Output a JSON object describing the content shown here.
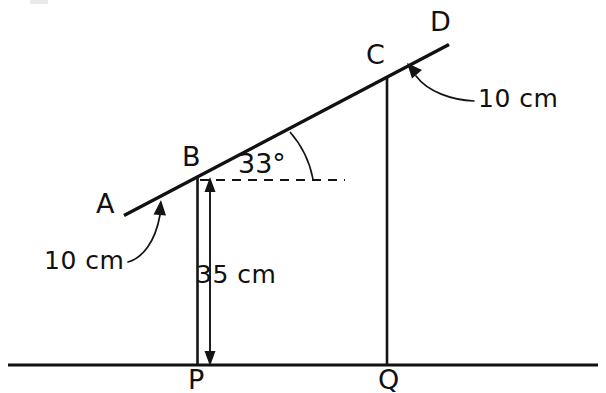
{
  "diagram": {
    "type": "geometry-line-diagram",
    "points": {
      "A": {
        "label": "A",
        "x": 125,
        "y": 215
      },
      "B": {
        "label": "B",
        "x": 196,
        "y": 178
      },
      "C": {
        "label": "C",
        "x": 386,
        "y": 77
      },
      "D": {
        "label": "D",
        "x": 448,
        "y": 45
      },
      "P": {
        "label": "P",
        "x": 197,
        "y": 365
      },
      "Q": {
        "label": "Q",
        "x": 387,
        "y": 365
      }
    },
    "labels": {
      "point_a": "A",
      "point_b": "B",
      "point_c": "C",
      "point_d": "D",
      "point_p": "P",
      "point_q": "Q"
    },
    "angle": {
      "value": "33°",
      "vertex": "B",
      "between": "line BD and horizontal dashed reference"
    },
    "measurements": {
      "height_bp": "35 cm",
      "overhang_ab": "10 cm",
      "overhang_cd": "10 cm"
    },
    "colors": {
      "ink": "#111111",
      "background": "#ffffff"
    }
  }
}
